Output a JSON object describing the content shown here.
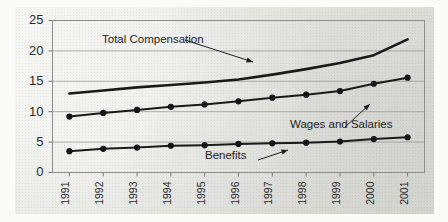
{
  "chart_data": {
    "type": "line",
    "title": "",
    "xlabel": "",
    "ylabel": "",
    "ylim": [
      0,
      25
    ],
    "yticks": [
      0,
      5,
      10,
      15,
      20,
      25
    ],
    "grid": true,
    "legend_position": "inline-annotations",
    "categories": [
      "1991",
      "1992",
      "1993",
      "1994",
      "1995",
      "1996",
      "1997",
      "1998",
      "1999",
      "2000",
      "2001"
    ],
    "series": [
      {
        "name": "Total Compensation",
        "style": "thick-line-no-markers",
        "values": [
          13.0,
          13.5,
          14.0,
          14.4,
          14.8,
          15.3,
          16.1,
          17.0,
          18.0,
          19.3,
          21.9
        ]
      },
      {
        "name": "Wages and Salaries",
        "style": "line-with-markers",
        "values": [
          9.2,
          9.8,
          10.3,
          10.8,
          11.2,
          11.7,
          12.3,
          12.8,
          13.4,
          14.6,
          15.6
        ]
      },
      {
        "name": "Benefits",
        "style": "line-with-markers",
        "values": [
          3.5,
          3.9,
          4.1,
          4.4,
          4.5,
          4.7,
          4.8,
          4.9,
          5.1,
          5.5,
          5.8
        ]
      }
    ],
    "annotations": [
      {
        "text": "Total Compensation",
        "target_series": "Total Compensation"
      },
      {
        "text": "Wages and Salaries",
        "target_series": "Wages and Salaries"
      },
      {
        "text": "Benefits",
        "target_series": "Benefits"
      }
    ],
    "colors": {
      "line": "#1a1a1a",
      "grid": "#9a9a98",
      "frame": "#8d8d8b",
      "background": "#e4e4e0",
      "text": "#2a2a2a"
    }
  }
}
